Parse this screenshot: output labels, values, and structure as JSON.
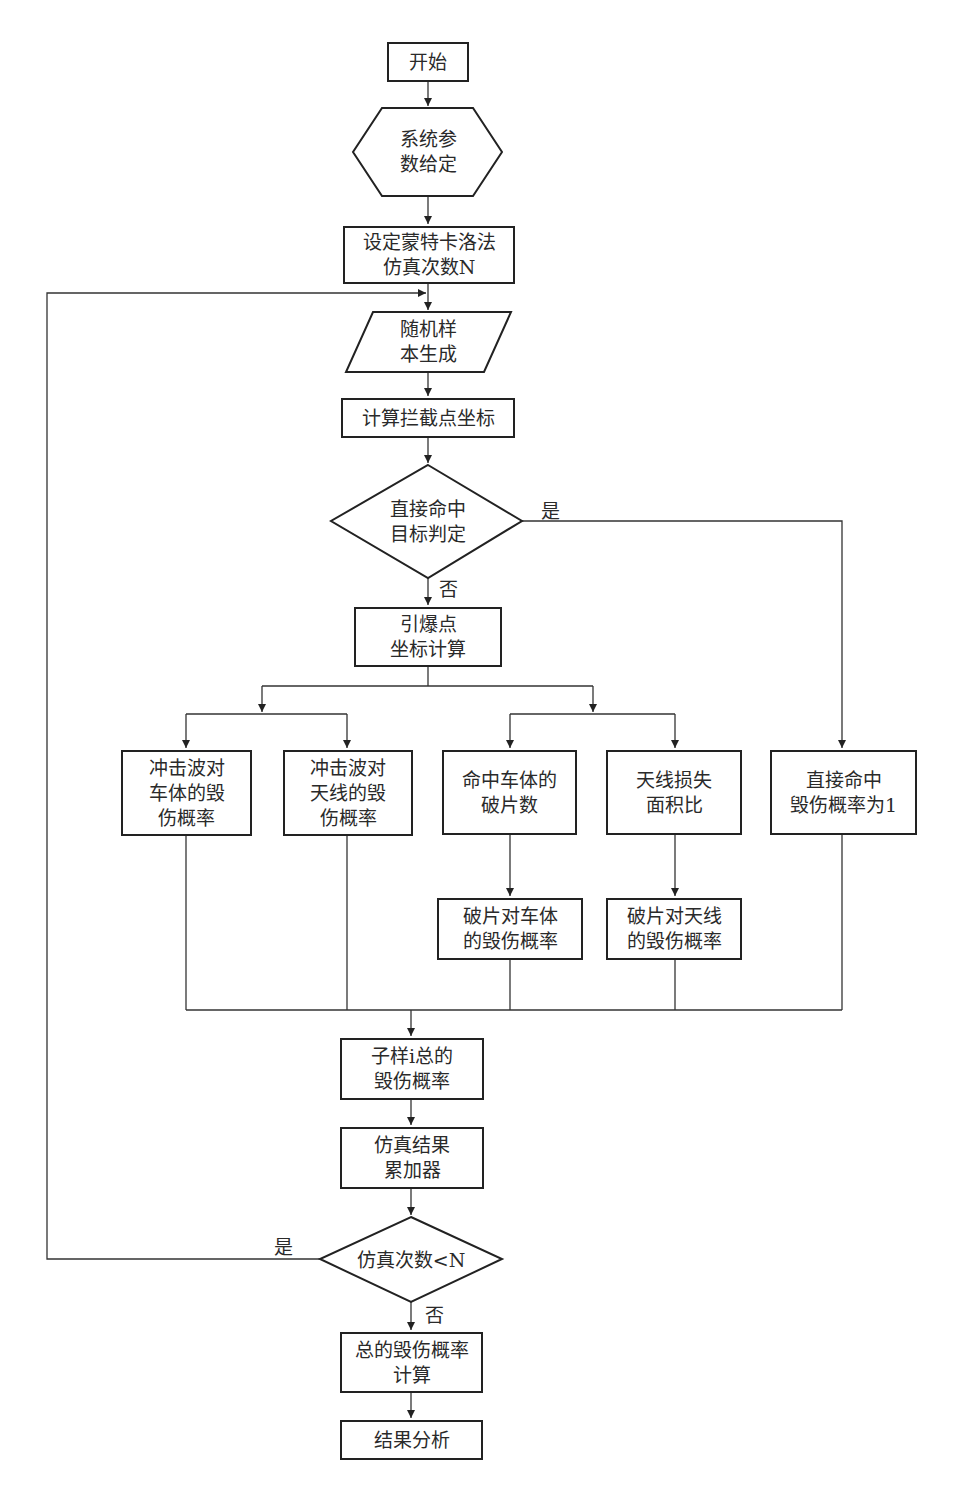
{
  "diagram": {
    "type": "flowchart",
    "language": "zh",
    "nodes": {
      "start": "开始",
      "params": "系统参\n数给定",
      "set_n": "设定蒙特卡洛法\n仿真次数N",
      "random_sample": "随机样\n本生成",
      "intercept": "计算拦截点坐标",
      "direct_hit_decision": "直接命中\n目标判定",
      "detonation": "引爆点\n坐标计算",
      "blast_vehicle": "冲击波对\n车体的毁\n伤概率",
      "blast_antenna": "冲击波对\n天线的毁\n伤概率",
      "fragments_vehicle": "命中车体的\n破片数",
      "antenna_area": "天线损失\n面积比",
      "direct_hit_prob": "直接命中\n毁伤概率为1",
      "frag_vehicle_prob": "破片对车体\n的毁伤概率",
      "frag_antenna_prob": "破片对天线\n的毁伤概率",
      "sample_total": "子样i总的\n毁伤概率",
      "accumulator": "仿真结果\n累加器",
      "loop_decision": "仿真次数<N",
      "total_prob": "总的毁伤概率\n计算",
      "analysis": "结果分析"
    },
    "edge_labels": {
      "direct_yes": "是",
      "direct_no": "否",
      "loop_yes": "是",
      "loop_no": "否"
    },
    "edges": [
      [
        "start",
        "params"
      ],
      [
        "params",
        "set_n"
      ],
      [
        "set_n",
        "random_sample"
      ],
      [
        "random_sample",
        "intercept"
      ],
      [
        "intercept",
        "direct_hit_decision"
      ],
      [
        "direct_hit_decision",
        "detonation",
        "否"
      ],
      [
        "direct_hit_decision",
        "direct_hit_prob",
        "是"
      ],
      [
        "detonation",
        "blast_vehicle"
      ],
      [
        "detonation",
        "blast_antenna"
      ],
      [
        "detonation",
        "fragments_vehicle"
      ],
      [
        "detonation",
        "antenna_area"
      ],
      [
        "fragments_vehicle",
        "frag_vehicle_prob"
      ],
      [
        "antenna_area",
        "frag_antenna_prob"
      ],
      [
        "blast_vehicle",
        "sample_total"
      ],
      [
        "blast_antenna",
        "sample_total"
      ],
      [
        "frag_vehicle_prob",
        "sample_total"
      ],
      [
        "frag_antenna_prob",
        "sample_total"
      ],
      [
        "direct_hit_prob",
        "sample_total"
      ],
      [
        "sample_total",
        "accumulator"
      ],
      [
        "accumulator",
        "loop_decision"
      ],
      [
        "loop_decision",
        "random_sample",
        "是"
      ],
      [
        "loop_decision",
        "total_prob",
        "否"
      ],
      [
        "total_prob",
        "analysis"
      ]
    ]
  }
}
